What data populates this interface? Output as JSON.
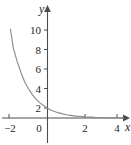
{
  "figure": {
    "background_color": "#ffffff",
    "width": 131,
    "height": 145
  },
  "axes": {
    "x_axis_label": "x",
    "y_axis_label": "y",
    "x_ticks": [
      "−2",
      "0",
      "2",
      "4"
    ],
    "y_ticks": [
      "2",
      "4",
      "6",
      "8",
      "10"
    ],
    "axis_color": "#4d4d4d",
    "curve_color": "#8c8c8c"
  },
  "chart_data": {
    "type": "line",
    "title": "",
    "xlabel": "x",
    "ylabel": "y",
    "grid": false,
    "legend": null,
    "xlim": [
      -2.2,
      4.6
    ],
    "ylim": [
      -0.6,
      11.6
    ],
    "xticks": [
      -2,
      0,
      2,
      4
    ],
    "xticklabels": [
      "−2",
      "0",
      "2",
      "4"
    ],
    "yticks": [
      2,
      4,
      6,
      8,
      10
    ],
    "yticklabels": [
      "2",
      "4",
      "6",
      "8",
      "10"
    ],
    "series": [
      {
        "name": "exponential decay",
        "function": "y = 3^(-x)",
        "x": [
          -1.95,
          -1.8,
          -1.6,
          -1.4,
          -1.2,
          -1.0,
          -0.8,
          -0.6,
          -0.4,
          -0.2,
          0.0,
          0.2,
          0.4,
          0.6,
          0.8,
          1.0,
          1.2,
          1.5,
          2.0,
          2.5,
          3.0,
          3.5,
          4.0
        ],
        "y": [
          9.1,
          7.2,
          5.8,
          4.7,
          3.7,
          3.0,
          2.4,
          1.93,
          1.55,
          1.25,
          1.0,
          0.8,
          0.64,
          0.52,
          0.42,
          0.33,
          0.27,
          0.19,
          0.11,
          0.06,
          0.037,
          0.021,
          0.012
        ]
      }
    ]
  }
}
